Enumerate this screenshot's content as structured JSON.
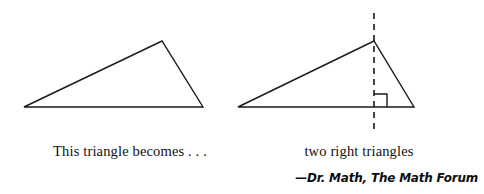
{
  "figure": {
    "type": "geometry-illustration",
    "background_color": "#ffffff",
    "stroke_color": "#1a1a1a",
    "captions": {
      "left": "This triangle becomes . . .",
      "right": "two right triangles"
    },
    "attribution": "—Dr. Math, The Math Forum",
    "shapes": {
      "left_triangle": {
        "name": "obtuse-scalene-triangle",
        "points": "24,107 162,41 203,107",
        "vertices": [
          {
            "label": "left-base-vertex",
            "x": 24,
            "y": 107
          },
          {
            "label": "apex",
            "x": 162,
            "y": 41
          },
          {
            "label": "right-base-vertex",
            "x": 203,
            "y": 107
          }
        ]
      },
      "right_triangle": {
        "name": "triangle-split-by-altitude",
        "points": "238,107 374,41 414,107",
        "vertices": [
          {
            "label": "left-base-vertex",
            "x": 238,
            "y": 107
          },
          {
            "label": "apex",
            "x": 374,
            "y": 41
          },
          {
            "label": "right-base-vertex",
            "x": 414,
            "y": 107
          }
        ],
        "altitude": {
          "label": "dashed-altitude-line",
          "x": 374,
          "y1": 13,
          "y2": 129,
          "dash_pattern": "6 5",
          "style": "dashed"
        },
        "right_angle_marker": {
          "label": "right-angle-square",
          "path": "M 374 94 L 387 94 L 387 107",
          "size": 13
        }
      }
    }
  }
}
